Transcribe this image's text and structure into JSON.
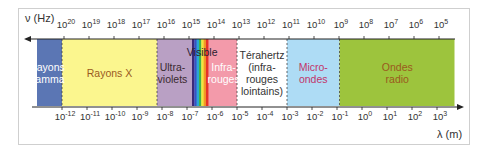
{
  "frequency_axis": {
    "label": "ν (Hz)",
    "ticks": [
      {
        "base": "10",
        "exp": "20"
      },
      {
        "base": "10",
        "exp": "19"
      },
      {
        "base": "10",
        "exp": "18"
      },
      {
        "base": "10",
        "exp": "17"
      },
      {
        "base": "10",
        "exp": "16"
      },
      {
        "base": "10",
        "exp": "15"
      },
      {
        "base": "10",
        "exp": "14"
      },
      {
        "base": "10",
        "exp": "13"
      },
      {
        "base": "10",
        "exp": "12"
      },
      {
        "base": "10",
        "exp": "11"
      },
      {
        "base": "10",
        "exp": "10"
      },
      {
        "base": "10",
        "exp": "9"
      },
      {
        "base": "10",
        "exp": "8"
      },
      {
        "base": "10",
        "exp": "7"
      },
      {
        "base": "10",
        "exp": "6"
      },
      {
        "base": "10",
        "exp": "5"
      }
    ]
  },
  "wavelength_axis": {
    "label": "λ (m)",
    "ticks": [
      {
        "base": "10",
        "exp": "-12"
      },
      {
        "base": "10",
        "exp": "-11"
      },
      {
        "base": "10",
        "exp": "-10"
      },
      {
        "base": "10",
        "exp": "-9"
      },
      {
        "base": "10",
        "exp": "-8"
      },
      {
        "base": "10",
        "exp": "-7"
      },
      {
        "base": "10",
        "exp": "-6"
      },
      {
        "base": "10",
        "exp": "-5"
      },
      {
        "base": "10",
        "exp": "-4"
      },
      {
        "base": "10",
        "exp": "-3"
      },
      {
        "base": "10",
        "exp": "-2"
      },
      {
        "base": "10",
        "exp": "-1"
      },
      {
        "base": "10",
        "exp": "0"
      },
      {
        "base": "10",
        "exp": "1"
      },
      {
        "base": "10",
        "exp": "2"
      },
      {
        "base": "10",
        "exp": "3"
      }
    ]
  },
  "bands": [
    {
      "id": "gamma",
      "lines": [
        "Rayons",
        "gamma"
      ],
      "fill": "#5b76b4",
      "text_color": "#ffffff",
      "lambda_from": -13.0,
      "lambda_to": -12.0
    },
    {
      "id": "xray",
      "lines": [
        "Rayons X"
      ],
      "fill": "#fbf68e",
      "text_color": "#9a5a1e",
      "lambda_from": -12.0,
      "lambda_to": -8.2
    },
    {
      "id": "uv",
      "lines": [
        "Ultra-",
        "violets"
      ],
      "fill": "#b9a0c4",
      "text_color": "#3a2a30",
      "lambda_from": -8.2,
      "lambda_to": -6.8
    },
    {
      "id": "ir",
      "lines": [
        "Infra-",
        "rouges"
      ],
      "fill": "#f39aaa",
      "text_color": "#ffffff",
      "lambda_from": -6.15,
      "lambda_to": -5.0
    },
    {
      "id": "thz",
      "lines": [
        "Térahertz",
        "(infra-",
        "rouges",
        "lointains)"
      ],
      "fill": "#ffffff",
      "text_color": "#333333",
      "lambda_from": -5.0,
      "lambda_to": -3.0
    },
    {
      "id": "micro",
      "lines": [
        "Micro-",
        "ondes"
      ],
      "fill": "#aedcf5",
      "text_color": "#c2356a",
      "lambda_from": -3.0,
      "lambda_to": -0.9
    },
    {
      "id": "radio",
      "lines": [
        "Ondes",
        "radio"
      ],
      "fill": "#9dc43d",
      "text_color": "#9a5a1e",
      "lambda_from": -0.9,
      "lambda_to": 3.7
    }
  ],
  "visible": {
    "label": "Visible",
    "lambda_from": -6.8,
    "lambda_to": -6.15,
    "colors": [
      "#3b2a7a",
      "#3552c4",
      "#2aa6d8",
      "#3fb24a",
      "#f2e53a",
      "#f39a26",
      "#e5332a"
    ]
  },
  "colors": {
    "axis": "#222222",
    "boundary": "#444444"
  }
}
